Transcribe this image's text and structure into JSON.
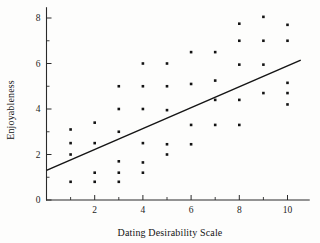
{
  "chart_data": {
    "type": "scatter",
    "title": "",
    "xlabel": "Dating Desirability Scale",
    "ylabel": "Enjoyableness",
    "xlim": [
      0,
      10.9
    ],
    "ylim": [
      0,
      8.45
    ],
    "xticks": [
      2,
      4,
      6,
      8,
      10
    ],
    "xtick_labels": [
      "2",
      "4",
      "6",
      "8",
      "10"
    ],
    "x_minor_ticks": [
      1,
      3,
      5,
      7,
      9
    ],
    "yticks": [
      0,
      2,
      4,
      6,
      8
    ],
    "ytick_labels": [
      "0",
      "2",
      "4",
      "6",
      "8"
    ],
    "y_minor_ticks": [
      1,
      3,
      5,
      7
    ],
    "grid": false,
    "legend": null,
    "point_color": "#131313",
    "line_color": "#151515",
    "axis_color": "#2a2a2a",
    "points": [
      {
        "x": 1,
        "y": 3.1
      },
      {
        "x": 1,
        "y": 2.5
      },
      {
        "x": 1,
        "y": 2.0
      },
      {
        "x": 1,
        "y": 0.8
      },
      {
        "x": 2,
        "y": 3.4
      },
      {
        "x": 2,
        "y": 2.5
      },
      {
        "x": 2,
        "y": 1.2
      },
      {
        "x": 2,
        "y": 0.8
      },
      {
        "x": 3,
        "y": 5.0
      },
      {
        "x": 3,
        "y": 4.0
      },
      {
        "x": 3,
        "y": 3.0
      },
      {
        "x": 3,
        "y": 1.7
      },
      {
        "x": 3,
        "y": 1.2
      },
      {
        "x": 3,
        "y": 0.8
      },
      {
        "x": 4,
        "y": 6.0
      },
      {
        "x": 4,
        "y": 5.0
      },
      {
        "x": 4,
        "y": 4.0
      },
      {
        "x": 4,
        "y": 2.5
      },
      {
        "x": 4,
        "y": 1.65
      },
      {
        "x": 4,
        "y": 1.2
      },
      {
        "x": 5,
        "y": 6.0
      },
      {
        "x": 5,
        "y": 5.0
      },
      {
        "x": 5,
        "y": 3.95
      },
      {
        "x": 5,
        "y": 2.45
      },
      {
        "x": 5,
        "y": 2.0
      },
      {
        "x": 6,
        "y": 6.5
      },
      {
        "x": 6,
        "y": 5.1
      },
      {
        "x": 6,
        "y": 3.3
      },
      {
        "x": 6,
        "y": 2.45
      },
      {
        "x": 7,
        "y": 6.5
      },
      {
        "x": 7,
        "y": 5.25
      },
      {
        "x": 7,
        "y": 4.4
      },
      {
        "x": 7,
        "y": 3.3
      },
      {
        "x": 8,
        "y": 7.75
      },
      {
        "x": 8,
        "y": 7.0
      },
      {
        "x": 8,
        "y": 5.95
      },
      {
        "x": 8,
        "y": 4.4
      },
      {
        "x": 8,
        "y": 3.3
      },
      {
        "x": 9,
        "y": 8.05
      },
      {
        "x": 9,
        "y": 7.0
      },
      {
        "x": 9,
        "y": 5.95
      },
      {
        "x": 9,
        "y": 4.7
      },
      {
        "x": 10,
        "y": 7.7
      },
      {
        "x": 10,
        "y": 7.0
      },
      {
        "x": 10,
        "y": 5.15
      },
      {
        "x": 10,
        "y": 4.7
      },
      {
        "x": 10,
        "y": 4.2
      }
    ],
    "regression": {
      "x_start": 0,
      "y_start": 1.3,
      "x_end": 10.55,
      "y_end": 6.15
    }
  }
}
